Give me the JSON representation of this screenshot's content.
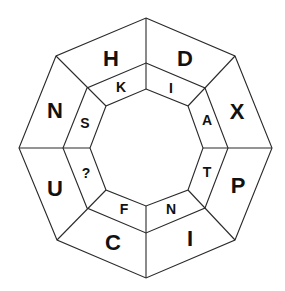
{
  "puzzle": {
    "type": "octagon-letter-ring",
    "outer_ring": [
      {
        "position": "top-left",
        "letter": "H"
      },
      {
        "position": "top-right",
        "letter": "D"
      },
      {
        "position": "right-upper",
        "letter": "X"
      },
      {
        "position": "right-lower",
        "letter": "P"
      },
      {
        "position": "bottom-right",
        "letter": "I"
      },
      {
        "position": "bottom-left",
        "letter": "C"
      },
      {
        "position": "left-lower",
        "letter": "U"
      },
      {
        "position": "left-upper",
        "letter": "N"
      }
    ],
    "inner_ring": [
      {
        "position": "top-left",
        "letter": "K"
      },
      {
        "position": "top-right",
        "letter": "I"
      },
      {
        "position": "right-upper",
        "letter": "A"
      },
      {
        "position": "right-lower",
        "letter": "T"
      },
      {
        "position": "bottom-right",
        "letter": "N"
      },
      {
        "position": "bottom-left",
        "letter": "F"
      },
      {
        "position": "left-lower",
        "letter": "?"
      },
      {
        "position": "left-upper",
        "letter": "S"
      }
    ]
  }
}
